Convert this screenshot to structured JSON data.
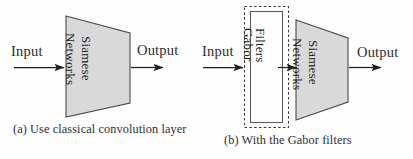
{
  "figure": {
    "subfigures": [
      {
        "id": "a",
        "caption": "(a) Use classical convolution layer",
        "input_label": "Input",
        "output_label": "Output",
        "blocks": [
          {
            "name": "siamese-networks",
            "shape": "trapezoid",
            "fill_color": "#d9d9d9",
            "stroke_color": "#4a4a4a",
            "text_lines": [
              "Networks",
              "Siamese"
            ],
            "text_orientation": "vertical-rotated-90"
          }
        ],
        "arrows": [
          {
            "name": "input-arrow",
            "from": "Input",
            "to": "siamese-networks"
          },
          {
            "name": "output-arrow",
            "from": "siamese-networks",
            "to": "Output"
          }
        ]
      },
      {
        "id": "b",
        "caption": "(b) With the Gabor filters",
        "input_label": "Input",
        "output_label": "Output",
        "blocks": [
          {
            "name": "gabor-filters",
            "shape": "rectangle",
            "fill_color": "#fdfdfd",
            "stroke_color": "#5a5a5a",
            "outer_border_style": "dashed",
            "outer_border_color": "#3a3a3a",
            "text_lines": [
              "Gabor",
              "Filters"
            ],
            "text_orientation": "vertical-rotated-90"
          },
          {
            "name": "siamese-networks",
            "shape": "trapezoid",
            "fill_color": "#d9d9d9",
            "stroke_color": "#4a4a4a",
            "text_lines": [
              "Networks",
              "Siamese"
            ],
            "text_orientation": "vertical-rotated-90"
          }
        ],
        "arrows": [
          {
            "name": "input-arrow",
            "from": "Input",
            "to": "gabor-filters"
          },
          {
            "name": "middle-arrow",
            "from": "gabor-filters",
            "to": "siamese-networks"
          },
          {
            "name": "output-arrow",
            "from": "siamese-networks",
            "to": "Output"
          }
        ]
      }
    ],
    "colors": {
      "background": "#fefefe",
      "block_fill": "#d9d9d9",
      "stroke": "#4a4a4a",
      "text": "#2b2b2b",
      "dashed_border": "#3a3a3a"
    }
  }
}
